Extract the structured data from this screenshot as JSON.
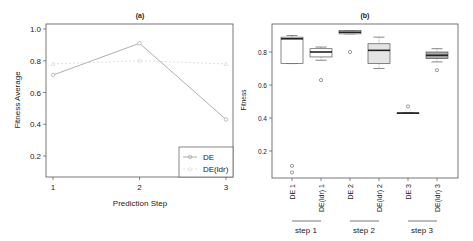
{
  "chart_data": [
    {
      "type": "line",
      "title": "(a)",
      "xlabel": "Prediction Step",
      "ylabel": "Fitness Average",
      "categories": [
        "1",
        "2",
        "3"
      ],
      "x": [
        1,
        2,
        3
      ],
      "yticks": [
        "0.2",
        "0.4",
        "0.6",
        "0.8",
        "1.0"
      ],
      "ylim": [
        0.05,
        1.03
      ],
      "grid": false,
      "legend_position": "bottom-right",
      "series": [
        {
          "name": "DE",
          "values": [
            0.71,
            0.91,
            0.43
          ],
          "color": "#9a9a9a",
          "line": "solid",
          "marker": "circle"
        },
        {
          "name": "DE(ldr)",
          "values": [
            0.78,
            0.8,
            0.78
          ],
          "color": "#d8d8d8",
          "line": "dashed",
          "marker": "triangle"
        }
      ]
    },
    {
      "type": "box",
      "title": "(b)",
      "xlabel": "",
      "ylabel": "Fitness",
      "yticks": [
        "0.2",
        "0.4",
        "0.6",
        "0.8"
      ],
      "ylim": [
        0.04,
        0.96
      ],
      "grid": false,
      "categories": [
        "DE 1",
        "DE(ldr) 1",
        "DE 2",
        "DE(ldr) 2",
        "DE 3",
        "DE(ldr) 3"
      ],
      "groups": [
        "step 1",
        "step 2",
        "step 3"
      ],
      "boxes": [
        {
          "label": "DE 1",
          "min": 0.73,
          "q1": 0.73,
          "median": 0.88,
          "q3": 0.89,
          "max": 0.9,
          "outliers": [
            0.11,
            0.07
          ],
          "fill": "#ffffff"
        },
        {
          "label": "DE(ldr) 1",
          "min": 0.75,
          "q1": 0.77,
          "median": 0.8,
          "q3": 0.82,
          "max": 0.83,
          "outliers": [
            0.63
          ],
          "fill": "#ffffff"
        },
        {
          "label": "DE 2",
          "min": 0.91,
          "q1": 0.91,
          "median": 0.92,
          "q3": 0.93,
          "max": 0.93,
          "outliers": [
            0.8
          ],
          "fill": "#ffffff"
        },
        {
          "label": "DE(ldr) 2",
          "min": 0.7,
          "q1": 0.73,
          "median": 0.81,
          "q3": 0.85,
          "max": 0.89,
          "outliers": [],
          "fill": "#e4e4e4"
        },
        {
          "label": "DE 3",
          "min": 0.43,
          "q1": 0.43,
          "median": 0.43,
          "q3": 0.43,
          "max": 0.43,
          "outliers": [
            0.47
          ],
          "fill": "#ffffff"
        },
        {
          "label": "DE(ldr) 3",
          "min": 0.74,
          "q1": 0.76,
          "median": 0.78,
          "q3": 0.8,
          "max": 0.82,
          "outliers": [
            0.69
          ],
          "fill": "#a9a9a9"
        }
      ]
    }
  ],
  "labels": {
    "plot_a_title": "(a)",
    "plot_b_title": "(b)",
    "plot_a_xlabel": "Prediction Step",
    "plot_a_ylabel": "Fitness Average",
    "plot_b_ylabel": "Fitness",
    "legend_de": "DE",
    "legend_deldr": "DE(ldr)",
    "group_step1": "step 1",
    "group_step2": "step 2",
    "group_step3": "step 3"
  }
}
